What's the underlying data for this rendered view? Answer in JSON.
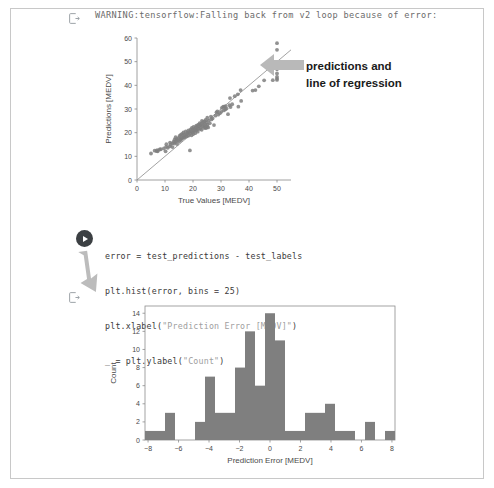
{
  "notebook": {
    "output_marker_icon": "logs-output-icon",
    "play_icon": "play-button-icon",
    "warning_output": "WARNING:tensorflow:Falling back from v2 loop because of error:",
    "annotation": {
      "line1": "predictions and",
      "line2": "line of regression",
      "arrow_icon": "left-arrow-annotation-icon",
      "down_arrow_icon": "down-right-arrow-annotation-icon"
    },
    "code_cell": {
      "lines": [
        "error = test_predictions - test_labels",
        "plt.hist(error, bins = 25)",
        "plt.xlabel(\"Prediction Error [MEDV]\")",
        "_ = plt.ylabel(\"Count\")"
      ],
      "line1_pre": "error = test_predictions - test_labels",
      "line2_pre": "plt.hist(error, bins = 25)",
      "line3_pre": "plt.xlabel(",
      "line3_str": "\"Prediction Error [MEDV]\"",
      "line3_post": ")",
      "line4_pre": "_ = plt.ylabel(",
      "line4_str": "\"Count\"",
      "line4_post": ")"
    }
  },
  "colors": {
    "marker_gray": "#7f7f7f",
    "bar_gray": "#7f7f7f",
    "axis_gray": "#555555",
    "page_border": "#c8c8c8",
    "code_text": "#3a3a3a",
    "warning_text": "#6b6b6b",
    "annotation_arrow": "#b4b4b4",
    "play_button": "#3c4043"
  },
  "chart_data": [
    {
      "type": "scatter",
      "title": "",
      "xlabel": "True Values [MEDV]",
      "ylabel": "Predictions [MEDV]",
      "xlim": [
        0,
        55
      ],
      "ylim": [
        0,
        60
      ],
      "xticks": [
        0,
        10,
        20,
        30,
        40,
        50
      ],
      "yticks": [
        0,
        10,
        20,
        30,
        40,
        50,
        60
      ],
      "grid": false,
      "legend": null,
      "annotations": [
        "predictions and line of regression"
      ],
      "reference_line": {
        "type": "identity",
        "from": [
          0,
          0
        ],
        "to": [
          55,
          55
        ]
      },
      "points": [
        [
          5.0,
          11.2
        ],
        [
          6.3,
          12.4
        ],
        [
          7.0,
          12.2
        ],
        [
          7.2,
          12.6
        ],
        [
          7.4,
          12.1
        ],
        [
          8.1,
          12.9
        ],
        [
          8.5,
          13.0
        ],
        [
          9.6,
          13.3
        ],
        [
          10.2,
          12.1
        ],
        [
          10.4,
          14.0
        ],
        [
          10.5,
          15.1
        ],
        [
          11.0,
          13.6
        ],
        [
          11.7,
          14.2
        ],
        [
          11.8,
          15.8
        ],
        [
          12.0,
          14.9
        ],
        [
          12.6,
          15.5
        ],
        [
          12.7,
          13.9
        ],
        [
          13.1,
          16.2
        ],
        [
          13.3,
          15.4
        ],
        [
          13.4,
          17.0
        ],
        [
          13.6,
          16.0
        ],
        [
          13.8,
          18.1
        ],
        [
          14.0,
          16.4
        ],
        [
          14.1,
          17.3
        ],
        [
          14.3,
          15.2
        ],
        [
          14.5,
          16.8
        ],
        [
          14.9,
          17.8
        ],
        [
          15.0,
          16.2
        ],
        [
          15.2,
          18.6
        ],
        [
          15.4,
          17.1
        ],
        [
          15.6,
          19.1
        ],
        [
          15.7,
          16.9
        ],
        [
          16.0,
          18.0
        ],
        [
          16.1,
          19.5
        ],
        [
          16.2,
          17.6
        ],
        [
          16.5,
          18.7
        ],
        [
          16.6,
          20.1
        ],
        [
          16.8,
          17.9
        ],
        [
          17.0,
          19.3
        ],
        [
          17.1,
          18.2
        ],
        [
          17.4,
          20.5
        ],
        [
          17.5,
          19.0
        ],
        [
          17.8,
          18.4
        ],
        [
          18.0,
          20.0
        ],
        [
          18.2,
          19.6
        ],
        [
          18.4,
          21.0
        ],
        [
          18.5,
          18.8
        ],
        [
          18.7,
          20.3
        ],
        [
          18.9,
          12.5
        ],
        [
          19.0,
          19.9
        ],
        [
          19.2,
          21.4
        ],
        [
          19.4,
          20.6
        ],
        [
          19.5,
          18.9
        ],
        [
          19.6,
          22.0
        ],
        [
          19.8,
          20.2
        ],
        [
          20.0,
          21.1
        ],
        [
          20.1,
          19.4
        ],
        [
          20.2,
          22.4
        ],
        [
          20.4,
          20.8
        ],
        [
          20.6,
          21.6
        ],
        [
          20.8,
          19.8
        ],
        [
          21.0,
          22.2
        ],
        [
          21.1,
          20.9
        ],
        [
          21.2,
          23.0
        ],
        [
          21.4,
          21.3
        ],
        [
          21.6,
          22.6
        ],
        [
          21.7,
          20.4
        ],
        [
          21.9,
          23.4
        ],
        [
          22.0,
          21.8
        ],
        [
          22.2,
          22.9
        ],
        [
          22.4,
          24.0
        ],
        [
          22.5,
          21.5
        ],
        [
          22.6,
          23.2
        ],
        [
          22.8,
          22.1
        ],
        [
          23.0,
          23.8
        ],
        [
          23.1,
          21.2
        ],
        [
          23.2,
          25.0
        ],
        [
          23.4,
          22.7
        ],
        [
          23.6,
          24.4
        ],
        [
          23.8,
          23.1
        ],
        [
          24.0,
          22.0
        ],
        [
          24.1,
          24.8
        ],
        [
          24.3,
          23.6
        ],
        [
          24.4,
          22.3
        ],
        [
          24.5,
          25.4
        ],
        [
          24.6,
          21.9
        ],
        [
          24.8,
          24.2
        ],
        [
          25.0,
          22.5
        ],
        [
          25.1,
          26.3
        ],
        [
          25.2,
          23.4
        ],
        [
          25.4,
          22.2
        ],
        [
          25.6,
          25.1
        ],
        [
          26.0,
          24.0
        ],
        [
          26.4,
          26.8
        ],
        [
          26.6,
          25.6
        ],
        [
          27.0,
          26.0
        ],
        [
          27.5,
          23.2
        ],
        [
          28.0,
          27.2
        ],
        [
          28.4,
          28.6
        ],
        [
          28.7,
          29.0
        ],
        [
          29.0,
          27.6
        ],
        [
          29.6,
          28.2
        ],
        [
          30.1,
          28.8
        ],
        [
          30.3,
          30.5
        ],
        [
          30.8,
          31.0
        ],
        [
          31.0,
          29.4
        ],
        [
          31.2,
          30.9
        ],
        [
          31.5,
          29.8
        ],
        [
          31.6,
          31.2
        ],
        [
          32.0,
          30.2
        ],
        [
          32.5,
          27.8
        ],
        [
          33.0,
          31.6
        ],
        [
          33.2,
          34.6
        ],
        [
          33.4,
          30.8
        ],
        [
          34.0,
          32.0
        ],
        [
          34.9,
          35.4
        ],
        [
          36.0,
          36.2
        ],
        [
          36.2,
          31.0
        ],
        [
          37.0,
          38.0
        ],
        [
          37.2,
          33.4
        ],
        [
          41.3,
          37.8
        ],
        [
          42.3,
          38.0
        ],
        [
          43.5,
          39.6
        ],
        [
          45.4,
          42.1
        ],
        [
          48.3,
          47.0
        ],
        [
          48.5,
          42.2
        ],
        [
          50.0,
          57.8
        ],
        [
          50.0,
          55.0
        ],
        [
          50.0,
          48.6
        ],
        [
          50.0,
          47.4
        ],
        [
          50.0,
          47.0
        ],
        [
          50.0,
          46.9
        ],
        [
          50.0,
          43.6
        ],
        [
          50.0,
          42.8
        ],
        [
          50.0,
          42.3
        ],
        [
          50.0,
          45.0
        ]
      ]
    },
    {
      "type": "bar",
      "chart_subtype": "histogram",
      "title": "",
      "xlabel": "Prediction Error [MEDV]",
      "ylabel": "Count",
      "xlim": [
        -8.2,
        8.2
      ],
      "ylim": [
        0,
        14.8
      ],
      "xticks": [
        -8,
        -6,
        -4,
        -2,
        0,
        2,
        4,
        6,
        8
      ],
      "yticks": [
        0,
        2,
        4,
        6,
        8,
        10,
        12,
        14
      ],
      "grid": false,
      "bins": 25,
      "bin_edges": [
        -8.2,
        -7.544,
        -6.888,
        -6.232,
        -5.576,
        -4.92,
        -4.264,
        -3.608,
        -2.952,
        -2.296,
        -1.64,
        -0.984,
        -0.328,
        0.328,
        0.984,
        1.64,
        2.296,
        2.952,
        3.608,
        4.264,
        4.92,
        5.576,
        6.232,
        6.888,
        7.544,
        8.2
      ],
      "categories": [
        "-8.2",
        "-7.5",
        "-6.9",
        "-6.2",
        "-5.6",
        "-4.9",
        "-4.3",
        "-3.6",
        "-3.0",
        "-2.3",
        "-1.6",
        "-1.0",
        "-0.3",
        "0.3",
        "1.0",
        "1.6",
        "2.3",
        "3.0",
        "3.6",
        "4.3",
        "4.9",
        "5.6",
        "6.2",
        "6.9",
        "7.5"
      ],
      "values": [
        1,
        1,
        3,
        0,
        0,
        2,
        7,
        3,
        3,
        8,
        12,
        6,
        14,
        11,
        1,
        1,
        3,
        3,
        4,
        1,
        1,
        0,
        2,
        0,
        1
      ]
    }
  ]
}
